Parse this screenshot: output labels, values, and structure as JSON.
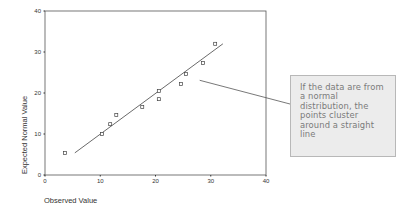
{
  "chart_data": {
    "type": "scatter",
    "title": "",
    "xlabel": "Observed Value",
    "ylabel": "Expected Normal Value",
    "xlim": [
      0,
      40
    ],
    "ylim": [
      0,
      40
    ],
    "x_ticks": [
      0,
      10,
      20,
      30,
      40
    ],
    "y_ticks": [
      0,
      10,
      20,
      30,
      40
    ],
    "grid": false,
    "series": [
      {
        "name": "points",
        "marker": "open-square",
        "points": [
          {
            "x": 3.6,
            "y": 5.4
          },
          {
            "x": 10.3,
            "y": 10.0
          },
          {
            "x": 11.8,
            "y": 12.4
          },
          {
            "x": 12.9,
            "y": 14.6
          },
          {
            "x": 17.6,
            "y": 16.6
          },
          {
            "x": 20.6,
            "y": 18.5
          },
          {
            "x": 20.6,
            "y": 20.5
          },
          {
            "x": 24.6,
            "y": 22.2
          },
          {
            "x": 25.5,
            "y": 24.6
          },
          {
            "x": 28.6,
            "y": 27.3
          },
          {
            "x": 30.8,
            "y": 32.0
          }
        ]
      }
    ],
    "reference_line": {
      "from": {
        "x": 5.4,
        "y": 5.4
      },
      "to": {
        "x": 32.2,
        "y": 32.0
      }
    },
    "annotation": {
      "text": "If the data are from a normal distribution, the points cluster around a straight line",
      "points_to": {
        "x": 28.0,
        "y": 23.1
      }
    }
  },
  "callout": {
    "text": "If the data are from a normal distribution, the points cluster around a straight line"
  }
}
